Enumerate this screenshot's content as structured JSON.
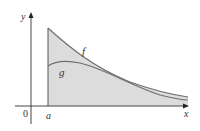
{
  "figure": {
    "type": "area-between-curves",
    "axes": {
      "x_label": "x",
      "y_label": "y",
      "origin_label": "0",
      "a_label": "a"
    },
    "curves": [
      {
        "name": "f",
        "label": "f",
        "color": "#6e6e6e"
      },
      {
        "name": "g",
        "label": "g",
        "color": "#6e6e6e"
      }
    ],
    "colors": {
      "fill_region": "#dcdcdc",
      "axis": "#333333",
      "curve": "#6e6e6e",
      "background": "#ffffff"
    }
  }
}
